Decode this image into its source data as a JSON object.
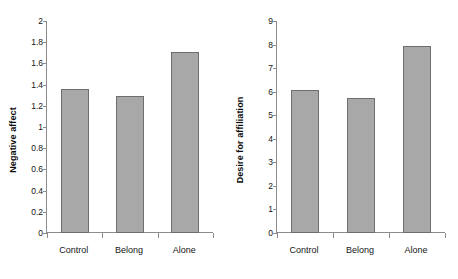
{
  "chart_data": [
    {
      "type": "bar",
      "title": "",
      "xlabel": "",
      "ylabel": "Negative affect",
      "categories": [
        "Control",
        "Belong",
        "Alone"
      ],
      "values": [
        1.36,
        1.29,
        1.71
      ],
      "ylim": [
        0,
        2
      ],
      "yticks": [
        0,
        0.2,
        0.4,
        0.6,
        0.8,
        1,
        1.2,
        1.4,
        1.6,
        1.8,
        2
      ],
      "ytick_labels": [
        "0",
        "0.2",
        "0.4",
        "0.6",
        "0.8",
        "1",
        "1.2",
        "1.4",
        "1.6",
        "1.8",
        "2"
      ],
      "grid": false,
      "legend": false,
      "bar_color": "#a8a8a8",
      "bar_edge_color": "#6e6e6e",
      "axis_color": "#8c8c8c"
    },
    {
      "type": "bar",
      "title": "",
      "xlabel": "",
      "ylabel": "Desire for affiliation",
      "categories": [
        "Control",
        "Belong",
        "Alone"
      ],
      "values": [
        6.09,
        5.73,
        7.92
      ],
      "ylim": [
        0,
        9
      ],
      "yticks": [
        0,
        1,
        2,
        3,
        4,
        5,
        6,
        7,
        8,
        9
      ],
      "ytick_labels": [
        "0",
        "1",
        "2",
        "3",
        "4",
        "5",
        "6",
        "7",
        "8",
        "9"
      ],
      "grid": false,
      "legend": false,
      "bar_color": "#a8a8a8",
      "bar_edge_color": "#6e6e6e",
      "axis_color": "#8c8c8c"
    }
  ]
}
